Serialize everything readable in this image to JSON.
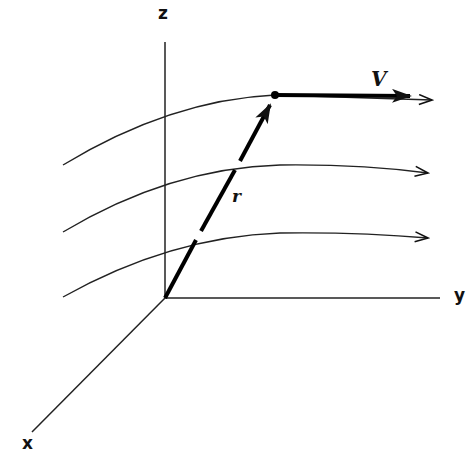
{
  "diagram": {
    "axes": {
      "x_label": "x",
      "y_label": "y",
      "z_label": "z"
    },
    "vectors": {
      "position_label": "r",
      "velocity_label": "V"
    },
    "streamline_count": 3,
    "colors": {
      "ink": "#111111",
      "background": "#ffffff"
    }
  }
}
